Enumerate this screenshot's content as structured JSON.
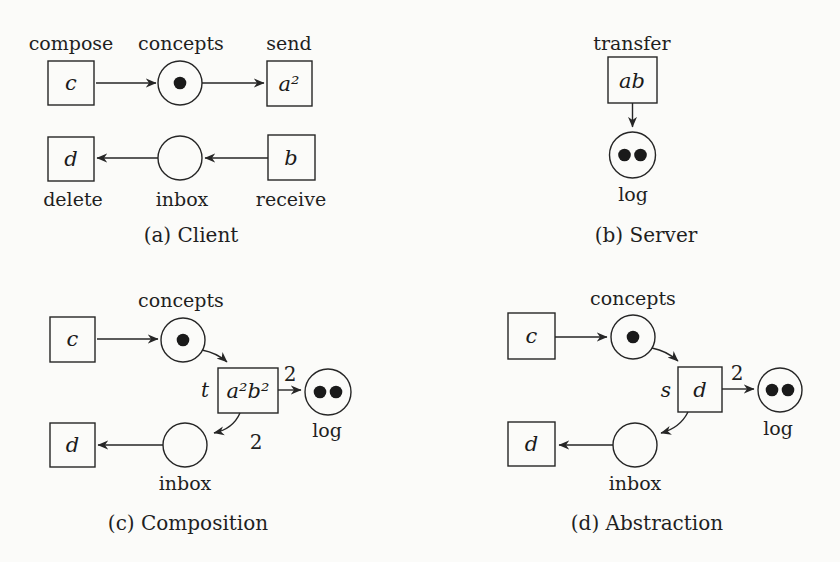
{
  "page": {
    "background": "#fbfbf9",
    "ink": "#262626"
  },
  "figures": {
    "client": {
      "caption": "(a) Client",
      "compose": {
        "label": "compose",
        "symbol": "c"
      },
      "concepts": {
        "label": "concepts",
        "tokens": 1
      },
      "send": {
        "label": "send",
        "symbol": "a²"
      },
      "receive": {
        "label": "receive",
        "symbol": "b"
      },
      "inbox": {
        "label": "inbox",
        "tokens": 0
      },
      "delete": {
        "label": "delete",
        "symbol": "d"
      }
    },
    "server": {
      "caption": "(b) Server",
      "transfer": {
        "label": "transfer",
        "symbol": "ab"
      },
      "log": {
        "label": "log",
        "tokens": 2
      }
    },
    "composition": {
      "caption": "(c) Composition",
      "compose": {
        "symbol": "c"
      },
      "concepts": {
        "label": "concepts",
        "tokens": 1
      },
      "t": {
        "name": "t",
        "symbol": "a²b²"
      },
      "log": {
        "label": "log",
        "tokens": 2
      },
      "inbox": {
        "label": "inbox",
        "tokens": 0
      },
      "delete": {
        "symbol": "d"
      },
      "weights": {
        "t_to_log": "2",
        "t_to_inbox": "2"
      }
    },
    "abstraction": {
      "caption": "(d) Abstraction",
      "compose": {
        "symbol": "c"
      },
      "concepts": {
        "label": "concepts",
        "tokens": 1
      },
      "s": {
        "name": "s",
        "symbol": "d"
      },
      "log": {
        "label": "log",
        "tokens": 2
      },
      "inbox": {
        "label": "inbox",
        "tokens": 0
      },
      "delete": {
        "symbol": "d"
      },
      "weights": {
        "s_to_log": "2"
      }
    }
  }
}
